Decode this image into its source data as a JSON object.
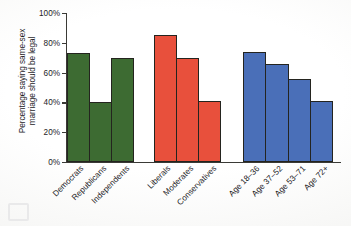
{
  "chart_data": {
    "type": "bar",
    "title": "",
    "xlabel": "",
    "ylabel": "Percentage saying same-sex\nmarriage should be legal",
    "ylim": [
      0,
      100
    ],
    "ytick_labels": [
      "0%",
      "20%",
      "40%",
      "60%",
      "80%",
      "100%"
    ],
    "ytick_values": [
      0,
      20,
      40,
      60,
      80,
      100
    ],
    "grid": false,
    "legend": "none",
    "categories": [
      "Democrats",
      "Republicans",
      "Independents",
      "Liberals",
      "Moderates",
      "Conservatives",
      "Age 18–36",
      "Age 37–52",
      "Age 53–71",
      "Age 72+"
    ],
    "values": [
      73,
      40,
      70,
      85,
      70,
      41,
      74,
      66,
      56,
      41
    ],
    "groups": [
      {
        "name": "party",
        "color": "#3d6b32",
        "categories": [
          "Democrats",
          "Republicans",
          "Independents"
        ],
        "values": [
          73,
          40,
          70
        ]
      },
      {
        "name": "ideology",
        "color": "#e8503c",
        "categories": [
          "Liberals",
          "Moderates",
          "Conservatives"
        ],
        "values": [
          85,
          70,
          41
        ]
      },
      {
        "name": "age",
        "color": "#4a6fb8",
        "categories": [
          "Age 18–36",
          "Age 37–52",
          "Age 53–71",
          "Age 72+"
        ],
        "values": [
          74,
          66,
          56,
          41
        ]
      }
    ]
  },
  "colors": {
    "party_green": "#3d6b32",
    "ideology_red": "#e8503c",
    "age_blue": "#4a6fb8",
    "axis": "#3a3a36",
    "text": "#23221f"
  }
}
